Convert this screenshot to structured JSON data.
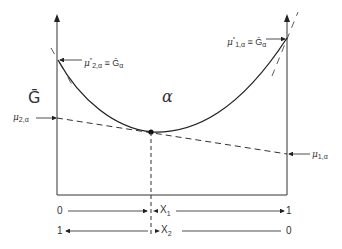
{
  "diagram": {
    "type": "gibbs-free-energy-composition",
    "y_axis_label": "Ḡ",
    "phase_label": "α",
    "labels": {
      "mu_2a_star": {
        "symbol": "μ",
        "sub": "2,α",
        "sup": "*",
        "eq": " ≡ Ḡ",
        "eq_sub": "α"
      },
      "mu_1a_star": {
        "symbol": "μ",
        "sub": "1,α",
        "sup": "*",
        "eq": " ≡ Ḡ",
        "eq_sub": "α"
      },
      "mu_2a": {
        "symbol": "μ",
        "sub": "2,α"
      },
      "mu_1a": {
        "symbol": "μ",
        "sub": "1,α"
      }
    },
    "composition_axes": {
      "x1": {
        "label": "X",
        "sub": "1",
        "left": "0",
        "right": "1"
      },
      "x2": {
        "label": "X",
        "sub": "2",
        "left": "1",
        "right": "0"
      }
    },
    "colors": {
      "line": "#222222",
      "background": "#ffffff"
    }
  }
}
